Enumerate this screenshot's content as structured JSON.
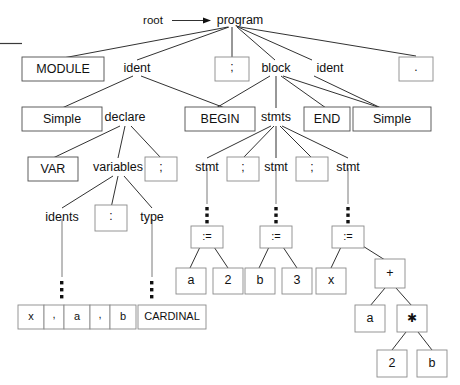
{
  "diagram": {
    "root_label": "root",
    "arrow_icon": "right-arrow-icon",
    "background": "#ffffff",
    "line_color": "#1a1a1a",
    "box_stroke": "#8a8a8a",
    "text_color": "#111111"
  },
  "nodes": {
    "program": "program",
    "module_kw": "MODULE",
    "ident_1": "ident",
    "semicolon_1": ";",
    "block": "block",
    "ident_2": "ident",
    "period": ".",
    "simple_1": "Simple",
    "declare": "declare",
    "begin_kw": "BEGIN",
    "stmts": "stmts",
    "end_kw": "END",
    "simple_2": "Simple",
    "var_kw": "VAR",
    "variables": "variables",
    "semicolon_2": ";",
    "stmt_1": "stmt",
    "semicolon_3": ";",
    "stmt_2": "stmt",
    "semicolon_4": ";",
    "stmt_3": "stmt",
    "idents": "idents",
    "colon": ":",
    "type": "type",
    "ellipsis_idents": "⋮",
    "ellipsis_type": "⋮",
    "ellipsis_stmt_1": "⋮",
    "ellipsis_stmt_2": "⋮",
    "ellipsis_stmt_3": "⋮",
    "ident_list": [
      "x",
      ",",
      "a",
      ",",
      "b"
    ],
    "cardinal": "CARDINAL",
    "assign_1": ":=",
    "assign_2": ":=",
    "assign_3": ":=",
    "operand_a1": "a",
    "operand_2": "2",
    "operand_b1": "b",
    "operand_3": "3",
    "operand_x": "x",
    "plus": "+",
    "operand_a2": "a",
    "times": "✱",
    "operand_2b": "2",
    "operand_b2": "b"
  }
}
